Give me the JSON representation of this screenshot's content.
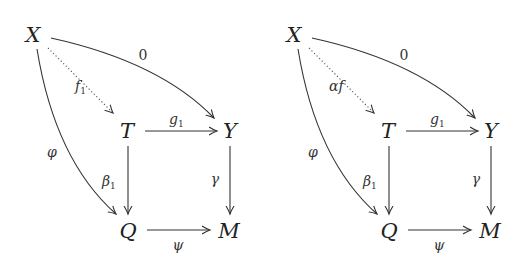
{
  "diagrams": [
    {
      "nodes": {
        "X": "X",
        "T": "T",
        "Y": "Y",
        "Q": "Q",
        "M": "M"
      },
      "labels": {
        "zero": "0",
        "dotted_main": "f",
        "dotted_sub": "1",
        "g_main": "g",
        "g_sub": "1",
        "phi": "φ",
        "beta_main": "β",
        "beta_sub": "1",
        "gamma": "γ",
        "psi": "ψ"
      }
    },
    {
      "nodes": {
        "X": "X",
        "T": "T",
        "Y": "Y",
        "Q": "Q",
        "M": "M"
      },
      "labels": {
        "zero": "0",
        "dotted_main": "αf",
        "dotted_sub": "",
        "g_main": "g",
        "g_sub": "1",
        "phi": "φ",
        "beta_main": "β",
        "beta_sub": "1",
        "gamma": "γ",
        "psi": "ψ"
      }
    }
  ]
}
